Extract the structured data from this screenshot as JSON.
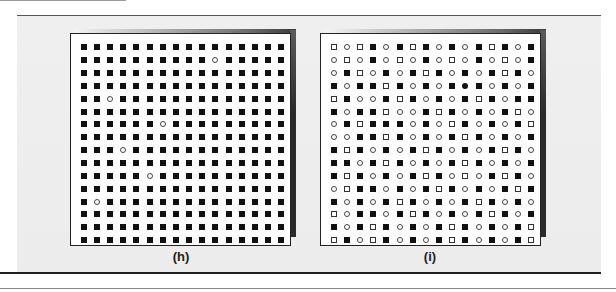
{
  "legend": {
    "S": "filled-square",
    "s": "open-square",
    "o": "open-circle",
    "O": "filled-circle"
  },
  "panels": [
    {
      "label": "(h)",
      "rows": [
        "SSSSSSSSSSSSSSSS",
        "SSSSSSSSSSoSSSSS",
        "SSSSSSSSSSSSSSSS",
        "SSSSSSSSSSSSSSSS",
        "SSoSSSSSSSSSSSSS",
        "SSSSSSSSSSSSSSSS",
        "SSSSSSoSSSSSSSSS",
        "SSSSSSSSSSSSSSSS",
        "SSSoSSSSSSSSSSSS",
        "SSSSSSSSSSSSSSSS",
        "SSSSSoSSSSSSSSSS",
        "SSSSSSSSSSSSSSSS",
        "SoSSSSSSSSSSSSSS",
        "SSSSSSSSSSSSSSSS",
        "SSSSSSSSSSSSSSSS",
        "SSSSSSSSSSSSSSSS"
      ]
    },
    {
      "label": "(i)",
      "rows": [
        "sosSoSsSoSoSsSoS",
        "osoSosoSosoSosoS",
        "oSsoSoSsSoSoSsSo",
        "SoSSsSoSoSOSoSoS",
        "sSooSsSoSoSsSoSS",
        "SoSSsooSsSoSoSso",
        "oSsSSSoSosSoSoSs",
        "ooSSsSoSoSsSoSoS",
        "SsSoSoSsSoSoSsSo",
        "SSoSsSoSoSsSoSoS",
        "SsSoSoSsSosoSsSo",
        "osSSoSoSsSoSoSsS",
        "SoSoSsSoSoSsSoSo",
        "soSSoSsSoSoSsSoS",
        "SoSsSoSoSsSoSoSs",
        "sSosSoSoSsSoSoSs"
      ]
    }
  ]
}
